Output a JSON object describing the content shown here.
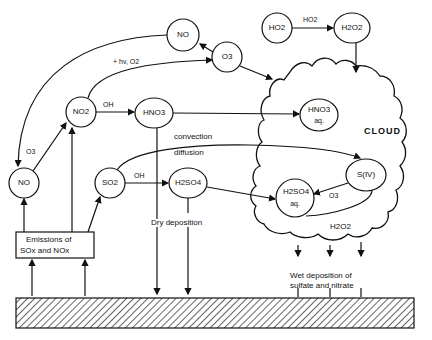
{
  "nodes": {
    "no_top": "NO",
    "o3": "O3",
    "ho2": "HO2",
    "h2o2": "H2O2",
    "no2": "NO2",
    "hno3": "HNO3",
    "hno3_aq": "HNO3",
    "hno3_aq_sub": "aq.",
    "no_left": "NO",
    "so2": "SO2",
    "h2so4": "H2SO4",
    "siv": "S(IV)",
    "h2so4_aq": "H2SO4",
    "h2so4_aq_sub": "aq."
  },
  "labels": {
    "hv_o2": "+ hv, O2",
    "oh_1": "OH",
    "oh_2": "OH",
    "o3_left": "O3",
    "o3_cloud": "O3",
    "ho2_arrow": "HO2",
    "convection": "convection",
    "diffusion": "diffusion",
    "cloud": "CLOUD",
    "h2o2_cloud": "H2O2",
    "dry_deposition": "Dry deposition",
    "wet_deposition_1": "Wet deposition of",
    "wet_deposition_2": "sulfate and nitrate",
    "emissions_1": "Emissions of",
    "emissions_2": "SOx and NOx"
  }
}
